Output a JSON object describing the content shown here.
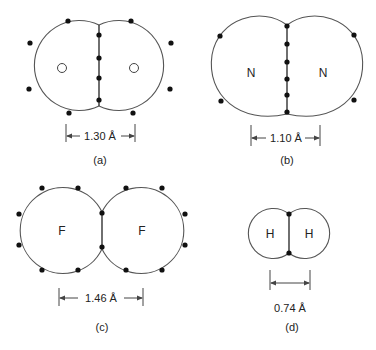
{
  "figure": {
    "panels": [
      {
        "id": "a",
        "caption": "(a)",
        "atom_labels": [
          "",
          ""
        ],
        "nucleus_markers": "hollow-circles",
        "bond_length": "1.30 Å",
        "shared_electrons": 4,
        "lone_electrons_per_atom": 4
      },
      {
        "id": "b",
        "caption": "(b)",
        "atom_labels": [
          "N",
          "N"
        ],
        "bond_length": "1.10 Å",
        "shared_electrons": 6,
        "lone_electrons_per_atom": 2
      },
      {
        "id": "c",
        "caption": "(c)",
        "atom_labels": [
          "F",
          "F"
        ],
        "bond_length": "1.46 Å",
        "shared_electrons": 2,
        "lone_electrons_per_atom": 6
      },
      {
        "id": "d",
        "caption": "(d)",
        "atom_labels": [
          "H",
          "H"
        ],
        "bond_length": "0.74 Å",
        "shared_electrons": 2,
        "lone_electrons_per_atom": 0
      }
    ],
    "colors": {
      "outline": "#555555",
      "electron": "#111111",
      "text": "#222222",
      "background": "#ffffff"
    }
  }
}
